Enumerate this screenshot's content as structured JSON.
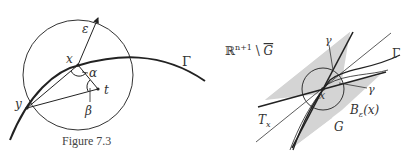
{
  "left_figure": {
    "caption": "Figure 7.3",
    "labels": {
      "epsilon": "ε",
      "x": "x",
      "alpha": "α",
      "t": "t",
      "y": "y",
      "beta": "β",
      "gamma_curve": "Γ"
    }
  },
  "right_figure": {
    "labels": {
      "complement": "ℝ",
      "complement_sup": "n+1",
      "complement_rest": " \\ ",
      "complement_G": "G",
      "gamma_top": "γ",
      "gamma_curve": "Γ",
      "gamma_right": "γ",
      "x": "x",
      "ball": "B",
      "ball_sub": "ε",
      "ball_arg": "(x)",
      "tangent": "T",
      "tangent_sub": "x",
      "region": "G"
    },
    "colors": {
      "shaded": "#d4d4d4",
      "ink": "#222222"
    }
  }
}
